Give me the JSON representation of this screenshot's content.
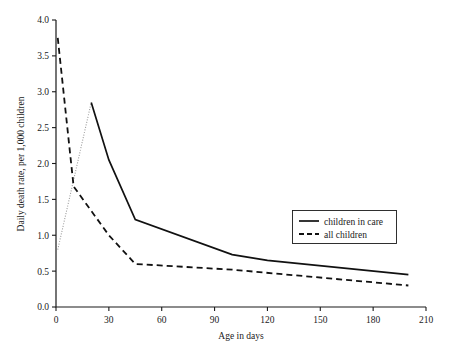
{
  "chart_data": {
    "type": "line",
    "title": "",
    "xlabel": "Age in days",
    "ylabel": "Daily death rate, per 1,000 children",
    "xlim": [
      0,
      210
    ],
    "ylim": [
      0,
      4.0
    ],
    "grid": false,
    "legend_position": "center-right",
    "xticks": [
      "0",
      "30",
      "60",
      "90",
      "120",
      "150",
      "180",
      "210"
    ],
    "xtick_values": [
      0,
      30,
      60,
      90,
      120,
      150,
      180,
      210
    ],
    "yticks": [
      "0.0",
      "0.5",
      "1.0",
      "1.5",
      "2.0",
      "2.5",
      "3.0",
      "3.5",
      "4.0"
    ],
    "ytick_values": [
      0.0,
      0.5,
      1.0,
      1.5,
      2.0,
      2.5,
      3.0,
      3.5,
      4.0
    ],
    "series": [
      {
        "name": "children in care",
        "style": "solid",
        "color": "#111111",
        "x": [
          1,
          20,
          30,
          45,
          100,
          120,
          200
        ],
        "values": [
          0.8,
          2.85,
          2.05,
          1.22,
          0.73,
          0.65,
          0.45
        ]
      },
      {
        "name": "all children",
        "style": "dashed",
        "color": "#111111",
        "x": [
          1,
          10,
          30,
          45,
          100,
          200
        ],
        "values": [
          3.75,
          1.68,
          1.0,
          0.6,
          0.52,
          0.3
        ]
      }
    ]
  },
  "legend": {
    "entries": [
      {
        "label": "children in care",
        "style": "solid"
      },
      {
        "label": "all children",
        "style": "dashed"
      }
    ]
  }
}
